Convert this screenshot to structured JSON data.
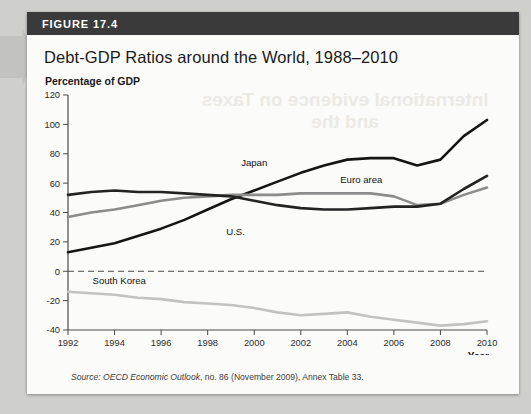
{
  "figure": {
    "number_label": "FIGURE 17.4",
    "title": "Debt-GDP Ratios around the World, 1988–2010",
    "unit_label": "Percentage of GDP",
    "source_prefix": "Source: ",
    "source_italic": "OECD Economic Outlook",
    "source_rest": ", no. 86 (November 2009), Annex Table 33.",
    "bleed_text": "International evidence on Taxes and the"
  },
  "colors": {
    "header_bar": "#3a3a3a",
    "card": "#fbfbf9",
    "page": "#cfcfcb",
    "japan": "#151515",
    "us": "#232323",
    "euro": "#8c8c8c",
    "south_korea": "#c2c2c2",
    "axis": "#4a4a4a",
    "zero_line": "#4a4a4a"
  },
  "chart_data": {
    "type": "line",
    "title": "Debt-GDP Ratios around the World, 1988–2010",
    "xlabel": "Year",
    "ylabel": "Percentage of GDP",
    "xlim": [
      1992,
      2010
    ],
    "ylim": [
      -40,
      120
    ],
    "ytick_step": 20,
    "xtick_step": 2,
    "yticks": [
      120,
      100,
      80,
      60,
      40,
      20,
      0,
      -20,
      -40
    ],
    "xticks": [
      1992,
      1994,
      1996,
      1998,
      2000,
      2002,
      2004,
      2006,
      2008,
      2010
    ],
    "grid": false,
    "zero_reference_line": true,
    "legend": "inline-labels",
    "x": [
      1992,
      1993,
      1994,
      1995,
      1996,
      1997,
      1998,
      1999,
      2000,
      2001,
      2002,
      2003,
      2004,
      2005,
      2006,
      2007,
      2008,
      2009,
      2010
    ],
    "series": [
      {
        "name": "Japan",
        "color": "#151515",
        "label_x": 2000,
        "label_y": 72,
        "values": [
          13,
          16,
          19,
          24,
          29,
          35,
          42,
          49,
          55,
          61,
          67,
          72,
          76,
          77,
          77,
          72,
          76,
          92,
          103
        ]
      },
      {
        "name": "Euro area",
        "color": "#8c8c8c",
        "label_x": 2004.6,
        "label_y": 60,
        "values": [
          37,
          40,
          42,
          45,
          48,
          50,
          51,
          52,
          52,
          52,
          53,
          53,
          53,
          53,
          51,
          45,
          46,
          52,
          57
        ]
      },
      {
        "name": "U.S.",
        "color": "#232323",
        "label_x": 1999.2,
        "label_y": 25,
        "values": [
          52,
          54,
          55,
          54,
          54,
          53,
          52,
          51,
          48,
          45,
          43,
          42,
          42,
          43,
          44,
          44,
          46,
          56,
          65
        ]
      },
      {
        "name": "South Korea",
        "color": "#c2c2c2",
        "label_x": 1994.2,
        "label_y": -9,
        "values": [
          -14,
          -15,
          -16,
          -18,
          -19,
          -21,
          -22,
          -23,
          -25,
          -28,
          -30,
          -29,
          -28,
          -31,
          -33,
          -35,
          -37,
          -36,
          -34
        ]
      }
    ]
  }
}
